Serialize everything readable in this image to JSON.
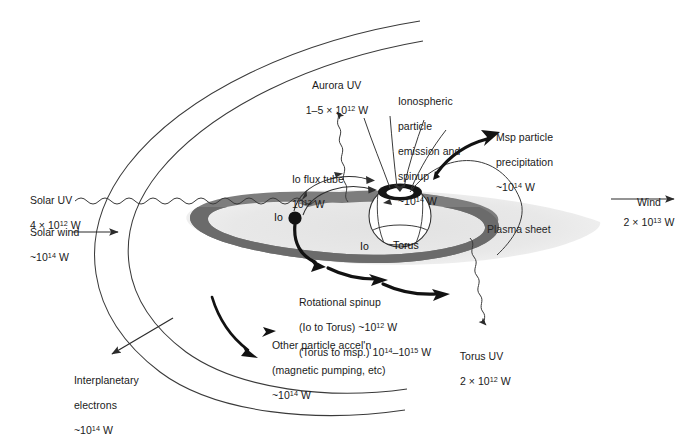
{
  "figure": {
    "colors": {
      "line": "#3a3a3a",
      "text": "#1a1a1a",
      "plasma_sheet": "#e9e9e9",
      "torus_ring": "#7f7f7f",
      "torus_ring_dark": "#6e6e6e",
      "planet_fill": "#ffffff",
      "aurora_ring": "#111111",
      "io_moon": "#111111",
      "background": "#ffffff"
    }
  },
  "labels": {
    "solar_uv": {
      "line1": "Solar UV",
      "line2_pre": "4 × 10",
      "line2_exp": "12",
      "line2_post": " W"
    },
    "solar_wind": {
      "line1": "Solar wind",
      "line2_pre": "~10",
      "line2_exp": "14",
      "line2_post": " W"
    },
    "interplanetary_electrons": {
      "line1": "Interplanetary",
      "line2": "electrons",
      "line3_pre": "~10",
      "line3_exp": "14",
      "line3_post": " W"
    },
    "aurora_uv": {
      "line1": "Aurora UV",
      "line2_pre": "1–5 × 10",
      "line2_exp": "12",
      "line2_post": " W"
    },
    "io_flux_tube": {
      "line1": "Io flux tube",
      "line2_pre": "10",
      "line2_exp": "12",
      "line2_post": " W"
    },
    "ionospheric": {
      "line1": "Ionospheric",
      "line2": "particle",
      "line3": "emission and",
      "line4": "spinup",
      "line5_pre": "~10",
      "line5_exp": "14",
      "line5_post": " W"
    },
    "msp_precipitation": {
      "line1": "Msp particle",
      "line2": "precipitation",
      "line3_pre": "~10",
      "line3_exp": "14",
      "line3_post": " W"
    },
    "wind": {
      "line1": "Wind",
      "line2_pre": "2 × 10",
      "line2_exp": "13",
      "line2_post": " W"
    },
    "plasma_sheet": {
      "text": "Plasma sheet"
    },
    "torus": {
      "text": "Torus"
    },
    "io_inner": {
      "text": "Io"
    },
    "io_moon": {
      "text": "Io"
    },
    "rotational_spinup": {
      "line1": "Rotational spinup",
      "line2_pre": "(Io to Torus) ~10",
      "line2_exp": "12",
      "line2_post": " W",
      "line3_pre": "(Torus to msp.) 10",
      "line3_exp": "14",
      "line3_mid": "–10",
      "line3_exp2": "15",
      "line3_post": " W"
    },
    "other_particle": {
      "line1": "Other particle accel'n",
      "line2": "(magnetic pumping, etc)",
      "line3_pre": "~10",
      "line3_exp": "14",
      "line3_post": " W"
    },
    "torus_uv": {
      "line1": "Torus UV",
      "line2_pre": "2 × 10",
      "line2_exp": "12",
      "line2_post": " W"
    }
  },
  "elements": {
    "bow_shock": "bow-shock-arc",
    "magnetopause": "magnetopause-arc",
    "planet": "jupiter-planet",
    "aurora_oval": "aurora-oval",
    "io_torus": "io-plasma-torus",
    "plasma_sheet_disk": "plasma-sheet-disk",
    "io_satellite": "io-satellite"
  }
}
